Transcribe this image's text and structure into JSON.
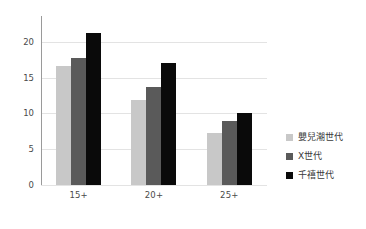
{
  "chart_data": {
    "type": "bar",
    "title": "",
    "subtitle": "",
    "xlabel": "",
    "ylabel": "",
    "categories": [
      "15+",
      "20+",
      "25+"
    ],
    "series": [
      {
        "name": "嬰兒潮世代",
        "color": "#c8c8c8",
        "values": [
          16.6,
          11.9,
          7.3
        ]
      },
      {
        "name": "X世代",
        "color": "#5a5a5a",
        "values": [
          17.7,
          13.7,
          9.0
        ]
      },
      {
        "name": "千禧世代",
        "color": "#0a0a0a",
        "values": [
          21.3,
          17.0,
          10.1
        ]
      }
    ],
    "ylim": [
      0,
      22.5
    ],
    "yticks": [
      0,
      5,
      10,
      15,
      20
    ],
    "ytick_labels": [
      "0",
      "5",
      "10",
      "15",
      "20"
    ],
    "grid": true,
    "grid_color": "#e3e3e3",
    "legend_position": "right",
    "background": "#ffffff",
    "axis_color": "#9a9a9a",
    "tick_label_color": "#4a4a4a"
  }
}
